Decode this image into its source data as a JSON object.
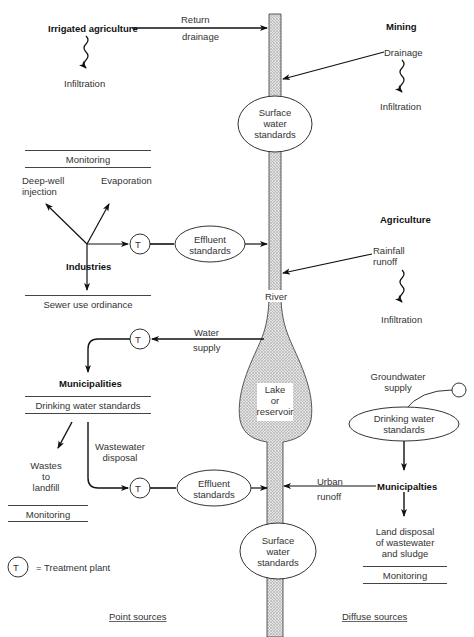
{
  "top": {
    "irrigated_agriculture": "Irrigated agriculture",
    "return_drainage_1": "Return",
    "return_drainage_2": "drainage",
    "infiltration_left": "Infiltration",
    "mining": "Mining",
    "drainage": "Drainage",
    "infiltration_mining": "Infiltration",
    "surface_water_top": [
      "Surface",
      "water",
      "standards"
    ]
  },
  "industries": {
    "monitoring": "Monitoring",
    "deep_well_1": "Deep-well",
    "deep_well_2": "injection",
    "evaporation": "Evaporation",
    "label": "Industries",
    "treatment": "T",
    "effluent": [
      "Effluent",
      "standards"
    ],
    "sewer": "Sewer use ordinance"
  },
  "agriculture": {
    "label": "Agriculture",
    "rainfall_1": "Rainfall",
    "rainfall_2": "runoff",
    "infiltration": "Infiltration"
  },
  "river": {
    "label": "River",
    "lake": [
      "Lake",
      "or",
      "reservoir"
    ]
  },
  "municipalities_left": {
    "water_supply_1": "Water",
    "water_supply_2": "supply",
    "treatment_in": "T",
    "label": "Municipalities",
    "drinking": "Drinking water standards",
    "wastes_1": "Wastes",
    "wastes_2": "to",
    "wastes_3": "landfill",
    "wastewater_1": "Wastewater",
    "wastewater_2": "disposal",
    "treatment_out": "T",
    "effluent": [
      "Effluent",
      "standards"
    ],
    "monitoring": "Monitoring"
  },
  "municipalities_right": {
    "groundwater_1": "Groundwater",
    "groundwater_2": "supply",
    "drinking": [
      "Drinking water",
      "standards"
    ],
    "label": "Municipalties",
    "urban_1": "Urban",
    "urban_2": "runoff",
    "land_1": "Land disposal",
    "land_2": "of wastewater",
    "land_3": "and sludge",
    "monitoring": "Monitoring"
  },
  "bottom": {
    "surface_water": [
      "Surface",
      "water",
      "standards"
    ],
    "legend_symbol": "T",
    "legend_text": "= Treatment plant",
    "point_sources": "Point sources",
    "diffuse_sources": "Diffuse sources"
  }
}
